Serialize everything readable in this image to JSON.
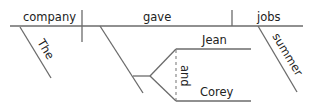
{
  "diagram": {
    "type": "sentence-diagram (Reed-Kellogg)",
    "sentence_words": {
      "subject": "company",
      "verb": "gave",
      "direct_object": "jobs",
      "subject_modifier": "The",
      "object_modifier": "summer",
      "indirect_objects": [
        "Jean",
        "Corey"
      ],
      "conjunction": "and"
    },
    "colors": {
      "line": "#6b6b6b",
      "text": "#222222",
      "background": "#ffffff"
    }
  }
}
